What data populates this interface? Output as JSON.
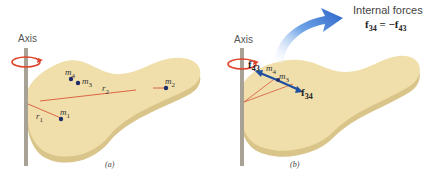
{
  "panel_a": {
    "axis_label": "Axis",
    "caption": "(a)",
    "masses": [
      {
        "symbol": "m",
        "sub": "1"
      },
      {
        "symbol": "m",
        "sub": "2"
      },
      {
        "symbol": "m",
        "sub": "3"
      },
      {
        "symbol": "m",
        "sub": "4"
      }
    ],
    "radii": [
      {
        "symbol": "r",
        "sub": "1"
      },
      {
        "symbol": "r",
        "sub": "2"
      }
    ]
  },
  "panel_b": {
    "axis_label": "Axis",
    "caption": "(b)",
    "masses": [
      {
        "symbol": "m",
        "sub": "3"
      },
      {
        "symbol": "m",
        "sub": "4"
      }
    ],
    "forces": [
      {
        "symbol": "f",
        "sub": "43"
      },
      {
        "symbol": "f",
        "sub": "34"
      }
    ],
    "callout": {
      "title": "Internal forces",
      "eq_lhs": "f",
      "eq_lhs_sub": "34",
      "eq_op": " = −",
      "eq_rhs": "f",
      "eq_rhs_sub": "43"
    }
  },
  "colors": {
    "slab_top": "#f0dfaa",
    "slab_edge": "#d9c48a",
    "axis_rod": "#a8a196",
    "rotation_arrow": "#e0442a",
    "radius_line": "#d8563c",
    "mass_dot": "#1f2a6b",
    "force_arrow": "#1f4fa0",
    "callout_arrow": "#2f6fd0"
  }
}
